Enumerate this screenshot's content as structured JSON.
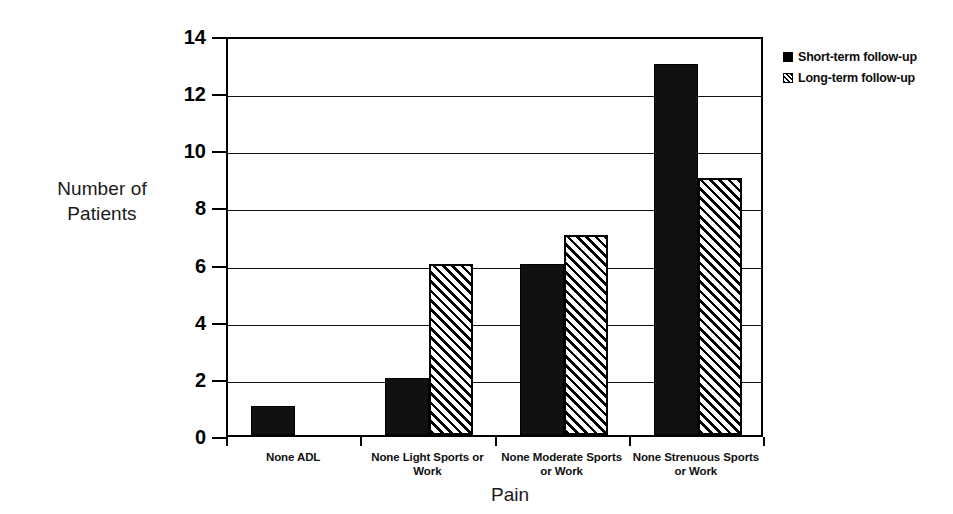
{
  "chart_data": {
    "type": "bar",
    "title": "",
    "xlabel": "Pain",
    "ylabel": "Number of Patients",
    "categories": [
      "None ADL",
      "None Light Sports or Work",
      "None Moderate Sports or Work",
      "None Strenuous Sports or Work"
    ],
    "series": [
      {
        "name": "Short-term follow-up",
        "values": [
          1,
          2,
          6,
          13
        ],
        "fill": "solid",
        "color": "#111111"
      },
      {
        "name": "Long-term follow-up",
        "values": [
          null,
          6,
          7,
          9
        ],
        "fill": "hatch",
        "color": "#000000"
      }
    ],
    "ylim": [
      0,
      14
    ],
    "yticks": [
      0,
      2,
      4,
      6,
      8,
      10,
      12,
      14
    ],
    "grid": true,
    "grid_axis": "y",
    "legend_position": "right-top"
  },
  "axes": {
    "y_title_line1": "Number of",
    "y_title_line2": "Patients",
    "x_title": "Pain"
  }
}
